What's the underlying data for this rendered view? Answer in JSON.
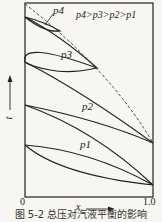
{
  "figure": {
    "caption": "图 5-2  总压对汽液平衡的影响",
    "relation": "p4>p3>p2>p1",
    "x_axis": {
      "label": "x",
      "tick_min": "0",
      "tick_max": "1.0"
    },
    "y_axis": {
      "label": "t"
    },
    "curves": [
      {
        "name": "p4",
        "label": "p4"
      },
      {
        "name": "p3",
        "label": "p3"
      },
      {
        "name": "p2",
        "label": "p2"
      },
      {
        "name": "p1",
        "label": "p1"
      }
    ],
    "dashed_line": "critical locus",
    "colors": {
      "line": "#222222",
      "background": "#f7f6f2"
    }
  }
}
